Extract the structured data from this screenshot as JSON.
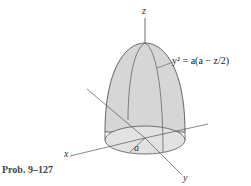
{
  "figure": {
    "axes": {
      "z": "z",
      "x": "x",
      "y": "y"
    },
    "radius_label": "a",
    "equation": "y² = a(a − z/2)",
    "caption": "Prob. 9–127"
  },
  "colors": {
    "surface": "#d4d4d4",
    "base": "#e0e0e0",
    "stroke": "#555555"
  }
}
